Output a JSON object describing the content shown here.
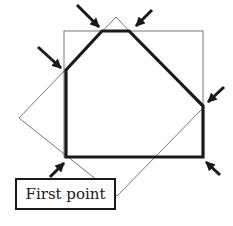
{
  "figure": {
    "label": "First point",
    "colors": {
      "stroke": "#1a1a1a",
      "thin_stroke": "#555555",
      "background": "#ffffff"
    },
    "shapes": {
      "square": "axis-aligned square",
      "diamond": "rotated square",
      "intersection": "clipped polygon (intersection)"
    },
    "markers": [
      {
        "name": "first-point-arrow"
      },
      {
        "name": "vertex-arrow-left-upper"
      },
      {
        "name": "vertex-arrow-top-left"
      },
      {
        "name": "vertex-arrow-top-right"
      },
      {
        "name": "vertex-arrow-right-upper"
      },
      {
        "name": "vertex-arrow-bottom-right"
      }
    ]
  }
}
